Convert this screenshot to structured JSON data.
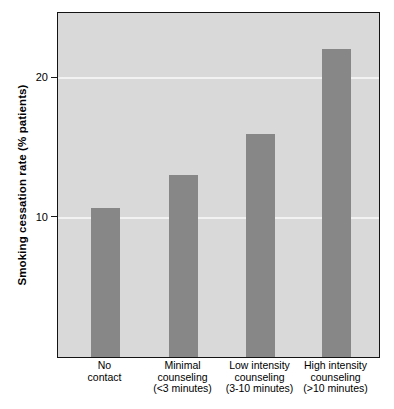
{
  "chart_data": {
    "type": "bar",
    "title": "",
    "xlabel": "",
    "ylabel": "Smoking cessation rate (% patients)",
    "categories": [
      "No contact",
      "Minimal counseling (<3 minutes)",
      "Low intensity counseling (3-10 minutes)",
      "High intensity counseling (>10 minutes)"
    ],
    "category_lines": [
      [
        "No",
        "contact"
      ],
      [
        "Minimal",
        "counseling",
        "(<3 minutes)"
      ],
      [
        "Low intensity",
        "counseling",
        "(3-10 minutes)"
      ],
      [
        "High intensity",
        "counseling",
        "(>10 minutes)"
      ]
    ],
    "values": [
      10.7,
      13.1,
      16.0,
      22.1
    ],
    "ylim": [
      0,
      24.7
    ],
    "yticks": [
      10,
      20
    ],
    "ytick_labels": [
      "10",
      "20"
    ],
    "grid": true,
    "grid_color": "#f2f2f2",
    "legend": null,
    "bar_color": "#878787",
    "plot_background": "#d9d9d9",
    "frame_color": "#141414"
  },
  "axis": {
    "y_title": "Smoking cessation rate (% patients)",
    "tick_20": "20",
    "tick_10": "10"
  },
  "xaxis": {
    "cat0_l0": "No",
    "cat0_l1": "contact",
    "cat1_l0": "Minimal",
    "cat1_l1": "counseling",
    "cat1_l2": "(<3 minutes)",
    "cat2_l0": "Low intensity",
    "cat2_l1": "counseling",
    "cat2_l2": "(3-10 minutes)",
    "cat3_l0": "High intensity",
    "cat3_l1": "counseling",
    "cat3_l2": "(>10 minutes)"
  }
}
